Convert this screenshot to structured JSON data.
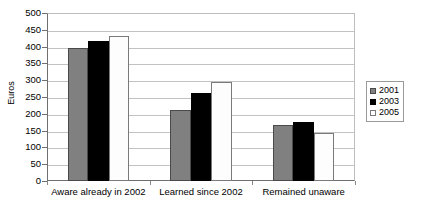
{
  "chart_data": {
    "type": "bar",
    "title": "",
    "subtitle": "",
    "xlabel": "",
    "ylabel": "Euros",
    "ylim": [
      0,
      500
    ],
    "ytick_step": 50,
    "yticks": [
      "500",
      "450",
      "400",
      "350",
      "300",
      "250",
      "200",
      "150",
      "100",
      "50",
      "0"
    ],
    "grid": true,
    "legend_position": "right",
    "categories": [
      "Aware already in 2002",
      "Learned since 2002",
      "Remained unaware"
    ],
    "series": [
      {
        "name": "2001",
        "color": "#808080",
        "values": [
          395,
          212,
          167
        ]
      },
      {
        "name": "2003",
        "color": "#000000",
        "values": [
          418,
          262,
          175
        ]
      },
      {
        "name": "2005",
        "color": "#ffffff",
        "values": [
          433,
          295,
          143
        ]
      }
    ]
  },
  "legend": {
    "entries": [
      "2001",
      "2003",
      "2005"
    ]
  }
}
